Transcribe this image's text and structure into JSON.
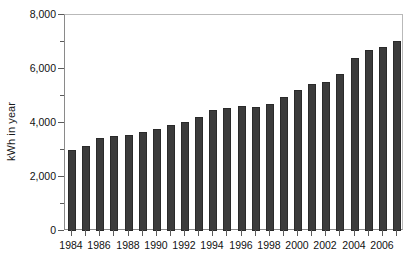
{
  "chart_data": {
    "type": "bar",
    "title": "",
    "subtitle": "",
    "xlabel": "",
    "ylabel": "kWh in year",
    "ylim": [
      0,
      8000
    ],
    "ytick_labels": [
      "0",
      "2,000",
      "4,000",
      "6,000",
      "8,000"
    ],
    "ytick_values": [
      0,
      2000,
      4000,
      6000,
      8000
    ],
    "yminor_values": [
      1000,
      3000,
      5000,
      7000
    ],
    "grid": false,
    "legend": null,
    "legend_position": "none",
    "bar_color": "#3b3b3b",
    "categories": [
      "1984",
      "1985",
      "1986",
      "1987",
      "1988",
      "1989",
      "1990",
      "1991",
      "1992",
      "1993",
      "1994",
      "1995",
      "1996",
      "1997",
      "1998",
      "1999",
      "2000",
      "2001",
      "2002",
      "2003",
      "2004",
      "2005",
      "2006",
      "2007"
    ],
    "xtick_labels_shown": [
      "1984",
      "1986",
      "1988",
      "1990",
      "1992",
      "1994",
      "1996",
      "1998",
      "2000",
      "2002",
      "2004",
      "2006"
    ],
    "values": [
      3000,
      3150,
      3450,
      3510,
      3560,
      3680,
      3780,
      3930,
      4030,
      4230,
      4500,
      4560,
      4620,
      4600,
      4690,
      4960,
      5210,
      5430,
      5520,
      5830,
      6400,
      6720,
      6820,
      7050
    ]
  },
  "axis": {
    "y_title": "kWh in year"
  }
}
